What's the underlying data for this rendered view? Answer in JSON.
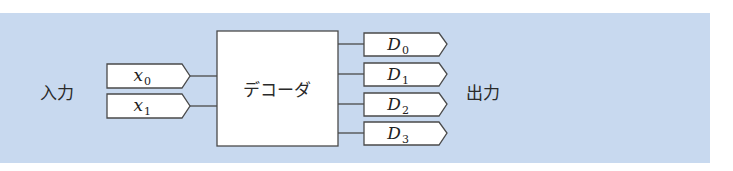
{
  "diagram": {
    "type": "decoder-block-diagram",
    "background_color": "#c8d9ef",
    "input_label": "入力",
    "output_label": "出力",
    "block_label": "デコーダ",
    "inputs": [
      {
        "var": "x",
        "sub": "0"
      },
      {
        "var": "x",
        "sub": "1"
      }
    ],
    "outputs": [
      {
        "var": "D",
        "sub": "0"
      },
      {
        "var": "D",
        "sub": "1"
      },
      {
        "var": "D",
        "sub": "2"
      },
      {
        "var": "D",
        "sub": "3"
      }
    ]
  }
}
